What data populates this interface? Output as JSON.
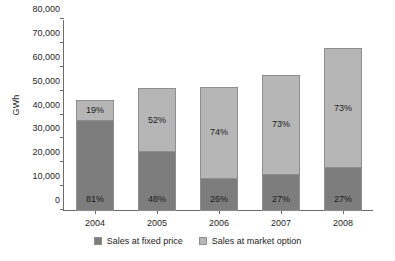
{
  "chart_data": {
    "type": "bar",
    "subtype": "stacked-vertical",
    "title": "",
    "xlabel": "",
    "ylabel": "GWh",
    "ylim": [
      0,
      80000
    ],
    "ytick_values": [
      0,
      10000,
      20000,
      30000,
      40000,
      50000,
      60000,
      70000,
      80000
    ],
    "ytick_labels": [
      "0",
      "10,000",
      "20,000",
      "30,000",
      "40,000",
      "50,000",
      "60,000",
      "70,000",
      "80,000"
    ],
    "grid": false,
    "legend_position": "bottom-center",
    "categories": [
      "2004",
      "2005",
      "2006",
      "2007",
      "2008"
    ],
    "series": [
      {
        "name": "Sales at fixed price",
        "color": "#7d7d7d",
        "values": [
          38000,
          25000,
          13700,
          15500,
          18500
        ],
        "data_labels": [
          "81%",
          "48%",
          "26%",
          "27%",
          "27%"
        ]
      },
      {
        "name": "Sales at market option",
        "color": "#b6b6b6",
        "values": [
          9000,
          27000,
          38800,
          42000,
          50000
        ],
        "data_labels": [
          "19%",
          "52%",
          "74%",
          "73%",
          "73%"
        ]
      }
    ],
    "totals": [
      47000,
      52000,
      52500,
      57500,
      68500
    ]
  },
  "legend": {
    "items": [
      {
        "label": "Sales at fixed price",
        "color": "#7d7d7d"
      },
      {
        "label": "Sales at market option",
        "color": "#b6b6b6"
      }
    ]
  },
  "axis": {
    "y_title": "GWh"
  }
}
